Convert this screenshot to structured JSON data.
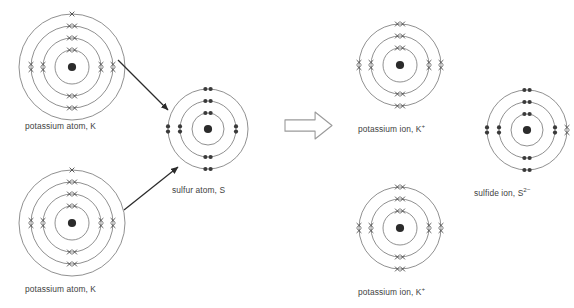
{
  "diagram": {
    "background_color": "#ffffff",
    "shell_stroke": "#6b6b6b",
    "nucleus_color": "#2b2b2b",
    "electron_dot_color": "#3a3a3a",
    "electron_cross_color": "#4a4a4a",
    "label_color": "#3f3f3f",
    "arrow_color": "#2b2b2b",
    "block_arrow_stroke": "#9a9a9a"
  },
  "species": [
    {
      "id": "potassium-atom-top",
      "label_main": "potassium atom, K",
      "label_sup": "",
      "element": "K",
      "x": 72,
      "y": 67,
      "shell_radii": [
        17,
        29,
        41,
        53
      ],
      "shell_counts": [
        2,
        8,
        8,
        1
      ],
      "electron_mark": "cross",
      "total_electrons": 19
    },
    {
      "id": "potassium-atom-bottom",
      "label_main": "potassium atom, K",
      "label_sup": "",
      "element": "K",
      "x": 72,
      "y": 223,
      "shell_radii": [
        17,
        29,
        41,
        53
      ],
      "shell_counts": [
        2,
        8,
        8,
        1
      ],
      "electron_mark": "cross",
      "total_electrons": 19
    },
    {
      "id": "sulfur-atom",
      "label_main": "sulfur atom, S",
      "label_sup": "",
      "element": "S",
      "x": 208,
      "y": 129,
      "shell_radii": [
        16,
        28,
        40
      ],
      "shell_counts": [
        2,
        8,
        6
      ],
      "electron_mark": "dot",
      "total_electrons": 16
    },
    {
      "id": "potassium-ion-top",
      "label_main": "potassium ion, K",
      "label_sup": "+",
      "element": "K",
      "x": 400,
      "y": 65,
      "shell_radii": [
        17,
        29,
        41
      ],
      "shell_counts": [
        2,
        8,
        8
      ],
      "electron_mark": "cross",
      "total_electrons": 18
    },
    {
      "id": "potassium-ion-bottom",
      "label_main": "potassium ion, K",
      "label_sup": "+",
      "element": "K",
      "x": 400,
      "y": 228,
      "shell_radii": [
        17,
        29,
        41
      ],
      "shell_counts": [
        2,
        8,
        8
      ],
      "electron_mark": "cross",
      "total_electrons": 18
    },
    {
      "id": "sulfide-ion",
      "label_main": "sulfide ion, S",
      "label_sup": "2−",
      "element": "S",
      "x": 527,
      "y": 130,
      "shell_radii": [
        16,
        28,
        40
      ],
      "shell_counts": [
        2,
        8,
        8
      ],
      "electron_mark": "dot",
      "outer_transferred": 2,
      "total_electrons": 18
    }
  ],
  "captions": [
    {
      "id": "caption-potassium-atom-top",
      "text": "potassium atom, K",
      "sup": "",
      "x": 25,
      "y": 121
    },
    {
      "id": "caption-potassium-atom-bottom",
      "text": "potassium atom, K",
      "sup": "",
      "x": 25,
      "y": 284
    },
    {
      "id": "caption-sulfur-atom",
      "text": "sulfur atom, S",
      "sup": "",
      "x": 172,
      "y": 185
    },
    {
      "id": "caption-potassium-ion-top",
      "text": "potassium ion, K",
      "sup": "+",
      "x": 358,
      "y": 122
    },
    {
      "id": "caption-potassium-ion-bottom",
      "text": "potassium ion, K",
      "sup": "+",
      "x": 358,
      "y": 285
    },
    {
      "id": "caption-sulfide-ion",
      "text": "sulfide ion, S",
      "sup": "2−",
      "x": 474,
      "y": 186
    }
  ],
  "transfer_arrows": [
    {
      "id": "transfer-arrow-top",
      "x1": 118,
      "y1": 60,
      "x2": 168,
      "y2": 110
    },
    {
      "id": "transfer-arrow-bottom",
      "x1": 124,
      "y1": 210,
      "x2": 178,
      "y2": 167
    }
  ],
  "reaction_arrow": {
    "id": "reaction-block-arrow",
    "x": 285,
    "y": 112,
    "width": 47,
    "height": 27,
    "direction": "right"
  }
}
